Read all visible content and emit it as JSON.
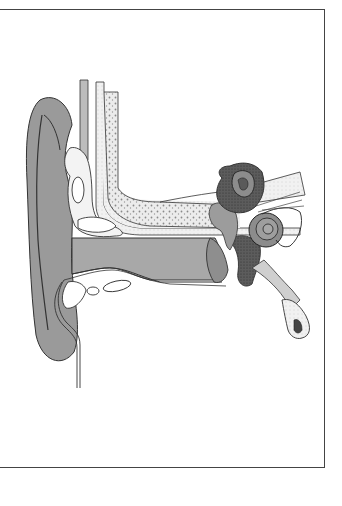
{
  "figure": {
    "parts": [
      {
        "id": "auricle",
        "label": "Auricle (pinna)"
      },
      {
        "id": "temporal-bone",
        "label": "Temporal bone"
      },
      {
        "id": "ear-canal",
        "label": "External auditory canal"
      },
      {
        "id": "tympanic-membrane",
        "label": "Tympanic membrane"
      },
      {
        "id": "ossicles",
        "label": "Ossicles"
      },
      {
        "id": "semicircular-canals",
        "label": "Semicircular canals"
      },
      {
        "id": "cochlea",
        "label": "Cochlea"
      },
      {
        "id": "auditory-nerve",
        "label": "Auditory nerve"
      },
      {
        "id": "eustachian-tube",
        "label": "Eustachian tube"
      }
    ],
    "colors": {
      "outline": "#333333",
      "skin": "#9a9a9a",
      "skin_dark": "#7d7d7d",
      "bone": "#e4e4e4",
      "bone_stipple": "#8a8a8a",
      "canal": "#a8a8a8",
      "inner_ear": "#5a5a5a",
      "frame": "#444444",
      "background": "#ffffff"
    }
  }
}
